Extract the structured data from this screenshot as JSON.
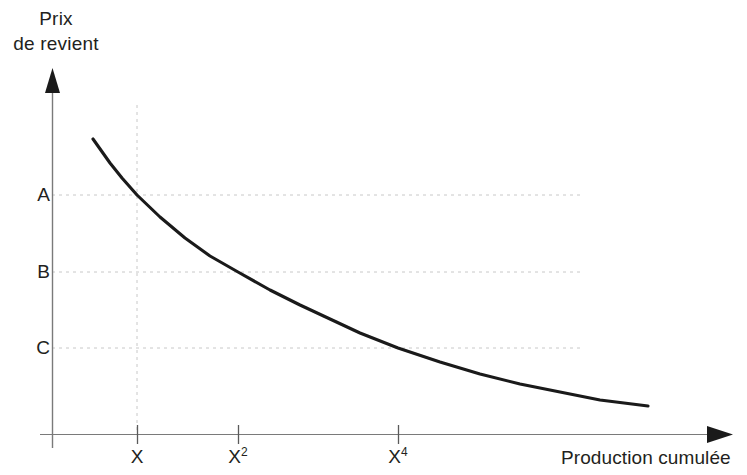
{
  "figure": {
    "background_color": "#ffffff",
    "ink_color": "#231f20",
    "grid_color": "#c8c8c8",
    "axis_color": "#6b6b6b",
    "curve_color": "#1a1a1a"
  },
  "axes": {
    "y_title_line1": "Prix",
    "y_title_line2": "de revient",
    "x_title": "Production cumulée",
    "y_ticks": [
      "A",
      "B",
      "C"
    ],
    "x_ticks": [
      {
        "base": "X",
        "exp": ""
      },
      {
        "base": "X",
        "exp": "2"
      },
      {
        "base": "X",
        "exp": "4"
      }
    ]
  },
  "chart_data": {
    "type": "line",
    "title": "",
    "subtitle": "",
    "xlabel": "Production cumulée",
    "ylabel": "Prix de revient",
    "grid": true,
    "legend": null,
    "xticklabels": [
      "X",
      "X²",
      "X⁴"
    ],
    "yticklabels": [
      "A",
      "B",
      "C"
    ],
    "xtick_positions_px": [
      137,
      238,
      398
    ],
    "ytick_positions_px": [
      195,
      272,
      348
    ],
    "xlim_px": [
      52,
      730
    ],
    "ylim_px": [
      70,
      434
    ],
    "annotations": [
      "Curve passes through (X, A)",
      "Curve passes through (X², B)",
      "Curve passes through (X⁴, C)"
    ],
    "series": [
      {
        "name": "Courbe d'expérience",
        "points_px": [
          [
            93,
            139
          ],
          [
            110,
            163
          ],
          [
            122,
            178
          ],
          [
            137,
            195
          ],
          [
            160,
            217
          ],
          [
            185,
            238
          ],
          [
            210,
            256
          ],
          [
            238,
            272
          ],
          [
            270,
            290
          ],
          [
            300,
            305
          ],
          [
            330,
            319
          ],
          [
            360,
            333
          ],
          [
            398,
            348
          ],
          [
            440,
            362
          ],
          [
            480,
            374
          ],
          [
            520,
            384
          ],
          [
            560,
            392
          ],
          [
            600,
            400
          ],
          [
            648,
            406
          ]
        ]
      }
    ]
  }
}
